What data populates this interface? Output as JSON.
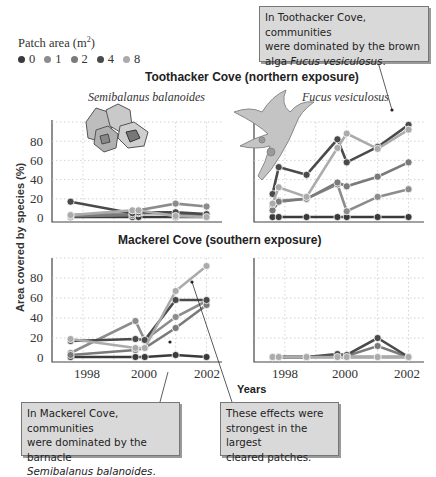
{
  "legend": {
    "title": "Patch area (m",
    "title_sup": "2",
    "title_end": ")",
    "items": [
      {
        "label": "0",
        "color": "#3a3a3a"
      },
      {
        "label": "1",
        "color": "#8c8c8c"
      },
      {
        "label": "2",
        "color": "#7a7a7a"
      },
      {
        "label": "4",
        "color": "#4a4a4a"
      },
      {
        "label": "8",
        "color": "#ababab"
      }
    ]
  },
  "titles": {
    "toothacker": "Toothacker Cove (northern exposure)",
    "mackerel": "Mackerel Cove (southern exposure)",
    "species_left": "Semibalanus balanoides",
    "species_right": "Fucus vesiculosus",
    "y_axis": "Area covered by species (%)",
    "x_axis": "Years"
  },
  "callouts": {
    "top_right": {
      "line1": "In Toothacker Cove, communities",
      "line2": "were dominated by the brown",
      "line3_plain": "alga ",
      "line3_italic": "Fucus vesiculosus",
      "line3_end": "."
    },
    "bottom_left": {
      "line1": "In Mackerel Cove, communities",
      "line2": "were dominated by the barnacle",
      "line3_italic": "Semibalanus balanoides",
      "line3_end": "."
    },
    "bottom_mid": {
      "line1": "These effects were",
      "line2": "strongest in the largest",
      "line3": "cleared patches."
    }
  },
  "chart_data": [
    {
      "type": "line",
      "title": "Toothacker Cove (northern exposure) — Semibalanus balanoides",
      "xlabel": "Years",
      "ylabel": "Area covered by species (%)",
      "ylim": [
        0,
        100
      ],
      "yticks": [
        0,
        20,
        40,
        60,
        80
      ],
      "x": [
        1997.6,
        1999.6,
        1999.8,
        2001.0,
        2002.0
      ],
      "grid": true,
      "series": [
        {
          "name": "0",
          "values": [
            1,
            1,
            1,
            1,
            1
          ]
        },
        {
          "name": "1",
          "values": [
            3,
            5,
            8,
            15,
            12
          ]
        },
        {
          "name": "2",
          "values": [
            2,
            3,
            5,
            5,
            3
          ]
        },
        {
          "name": "4",
          "values": [
            17,
            5,
            6,
            6,
            4
          ]
        },
        {
          "name": "8",
          "values": [
            3,
            8,
            8,
            2,
            1
          ]
        }
      ]
    },
    {
      "type": "line",
      "title": "Toothacker Cove (northern exposure) — Fucus vesiculosus",
      "xlabel": "Years",
      "ylabel": "Area covered by species (%)",
      "ylim": [
        0,
        100
      ],
      "yticks": [
        0,
        20,
        40,
        60,
        80
      ],
      "x": [
        1997.6,
        1997.8,
        1998.7,
        1999.7,
        2000.0,
        2001.0,
        2002.0
      ],
      "grid": true,
      "series": [
        {
          "name": "0",
          "values": [
            1,
            1,
            1,
            1,
            1,
            1,
            1
          ]
        },
        {
          "name": "1",
          "values": [
            12,
            18,
            20,
            35,
            7,
            22,
            30
          ]
        },
        {
          "name": "2",
          "values": [
            8,
            17,
            20,
            37,
            33,
            43,
            58
          ]
        },
        {
          "name": "4",
          "values": [
            25,
            53,
            45,
            82,
            58,
            74,
            97
          ]
        },
        {
          "name": "8",
          "values": [
            15,
            32,
            22,
            73,
            88,
            72,
            92
          ]
        }
      ]
    },
    {
      "type": "line",
      "title": "Mackerel Cove (southern exposure) — Semibalanus balanoides",
      "xlabel": "Years",
      "ylabel": "Area covered by species (%)",
      "ylim": [
        0,
        100
      ],
      "yticks": [
        0,
        20,
        40,
        60,
        80
      ],
      "xticks": [
        1998,
        2000,
        2002
      ],
      "x": [
        1997.6,
        1999.7,
        2000.0,
        2001.0,
        2002.0
      ],
      "grid": true,
      "series": [
        {
          "name": "0",
          "values": [
            1,
            1,
            1,
            3,
            1
          ]
        },
        {
          "name": "1",
          "values": [
            5,
            37,
            18,
            41,
            57
          ]
        },
        {
          "name": "2",
          "values": [
            3,
            8,
            10,
            30,
            53
          ]
        },
        {
          "name": "4",
          "values": [
            17,
            19,
            18,
            58,
            58
          ]
        },
        {
          "name": "8",
          "values": [
            19,
            10,
            10,
            67,
            92
          ]
        }
      ]
    },
    {
      "type": "line",
      "title": "Mackerel Cove (southern exposure) — Fucus vesiculosus",
      "xlabel": "Years",
      "ylabel": "Area covered by species (%)",
      "ylim": [
        0,
        100
      ],
      "yticks": [
        0,
        20,
        40,
        60,
        80
      ],
      "xticks": [
        1998,
        2000,
        2002
      ],
      "x": [
        1997.6,
        1997.8,
        1998.7,
        1999.7,
        2000.0,
        2001.0,
        2002.0
      ],
      "grid": true,
      "series": [
        {
          "name": "0",
          "values": [
            1,
            1,
            1,
            1,
            1,
            1,
            1
          ]
        },
        {
          "name": "1",
          "values": [
            1,
            1,
            1,
            1,
            1,
            1,
            1
          ]
        },
        {
          "name": "2",
          "values": [
            1,
            1,
            1,
            2,
            2,
            12,
            1
          ]
        },
        {
          "name": "4",
          "values": [
            1,
            1,
            1,
            4,
            3,
            20,
            1
          ]
        },
        {
          "name": "8",
          "values": [
            1,
            1,
            1,
            1,
            1,
            1,
            1
          ]
        }
      ]
    }
  ],
  "panels": [
    {
      "id": "tl",
      "yticks": [
        "80",
        "60",
        "40",
        "20",
        "0"
      ],
      "xticks": []
    },
    {
      "id": "tr",
      "yticks": [],
      "xticks": []
    },
    {
      "id": "bl",
      "yticks": [
        "80",
        "60",
        "40",
        "20",
        "0"
      ],
      "xticks": [
        "1998",
        "2000",
        "2002"
      ]
    },
    {
      "id": "br",
      "yticks": [],
      "xticks": [
        "1998",
        "2000",
        "2002"
      ]
    }
  ]
}
